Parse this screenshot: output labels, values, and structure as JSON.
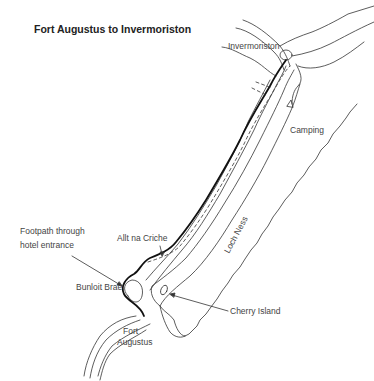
{
  "map": {
    "title": "Fort Augustus to Invermoriston",
    "labels": {
      "invermoriston": "Invermoriston",
      "camping": "Camping",
      "loch_ness": "Loch Ness",
      "allt_na_criche": "Allt na Criche",
      "footpath_line1": "Footpath through",
      "footpath_line2": "hotel entrance",
      "bunloit_brae": "Bunloit Brae",
      "cherry_island": "Cherry Island",
      "fort": "Fort",
      "augustus": "Augustus"
    },
    "colors": {
      "line": "#333333",
      "route": "#111111",
      "text": "#444444"
    }
  }
}
